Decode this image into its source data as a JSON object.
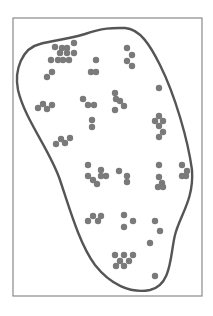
{
  "diagram": {
    "colors": {
      "background": "#ffffff",
      "frame": "#8a8a8a",
      "boundary": "#555555",
      "dot": "#7a7a7a"
    },
    "frame": {
      "x": 13,
      "y": 18,
      "width": 189,
      "height": 278
    },
    "boundary_path": "M 40 44 C 55 40, 65 40, 85 34 C 105 27, 115 28, 125 28 C 140 29, 150 45, 160 65 C 175 95, 188 140, 192 170 C 194 200, 180 215, 175 235 C 170 255, 172 285, 150 290 C 130 294, 110 284, 95 265 C 80 245, 70 210, 60 180 C 50 150, 25 120, 18 90 C 14 70, 22 48, 40 44 Z",
    "dot_radius": 3.2,
    "dots": [
      [
        55,
        47
      ],
      [
        62,
        48
      ],
      [
        67,
        48
      ],
      [
        74,
        43
      ],
      [
        60,
        53
      ],
      [
        67,
        53
      ],
      [
        74,
        53
      ],
      [
        58,
        60
      ],
      [
        63,
        60
      ],
      [
        69,
        60
      ],
      [
        51,
        60
      ],
      [
        52,
        72
      ],
      [
        47,
        77
      ],
      [
        96,
        60
      ],
      [
        91,
        72
      ],
      [
        96,
        72
      ],
      [
        127,
        48
      ],
      [
        132,
        55
      ],
      [
        127,
        61
      ],
      [
        132,
        66
      ],
      [
        159,
        88
      ],
      [
        38,
        108
      ],
      [
        43,
        104
      ],
      [
        47,
        109
      ],
      [
        52,
        105
      ],
      [
        83,
        99
      ],
      [
        88,
        105
      ],
      [
        94,
        105
      ],
      [
        115,
        93
      ],
      [
        116,
        99
      ],
      [
        120,
        101
      ],
      [
        124,
        106
      ],
      [
        115,
        110
      ],
      [
        92,
        120
      ],
      [
        92,
        127
      ],
      [
        159,
        116
      ],
      [
        155,
        121
      ],
      [
        163,
        121
      ],
      [
        159,
        126
      ],
      [
        163,
        132
      ],
      [
        159,
        137
      ],
      [
        56,
        144
      ],
      [
        61,
        139
      ],
      [
        65,
        143
      ],
      [
        70,
        138
      ],
      [
        88,
        165
      ],
      [
        101,
        170
      ],
      [
        88,
        176
      ],
      [
        93,
        180
      ],
      [
        101,
        176
      ],
      [
        106,
        176
      ],
      [
        97,
        184
      ],
      [
        119,
        171
      ],
      [
        127,
        176
      ],
      [
        127,
        182
      ],
      [
        159,
        165
      ],
      [
        159,
        177
      ],
      [
        162,
        183
      ],
      [
        158,
        187
      ],
      [
        163,
        187
      ],
      [
        182,
        165
      ],
      [
        187,
        171
      ],
      [
        182,
        176
      ],
      [
        186,
        176
      ],
      [
        88,
        221
      ],
      [
        93,
        216
      ],
      [
        98,
        221
      ],
      [
        101,
        216
      ],
      [
        124,
        215
      ],
      [
        133,
        221
      ],
      [
        124,
        227
      ],
      [
        155,
        221
      ],
      [
        160,
        231
      ],
      [
        150,
        243
      ],
      [
        115,
        255
      ],
      [
        120,
        261
      ],
      [
        124,
        255
      ],
      [
        129,
        261
      ],
      [
        133,
        255
      ],
      [
        116,
        266
      ],
      [
        124,
        266
      ],
      [
        155,
        276
      ]
    ]
  }
}
